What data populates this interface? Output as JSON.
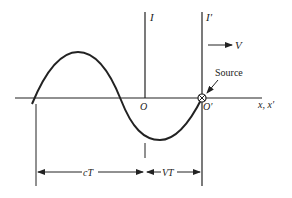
{
  "diagram": {
    "type": "wave-source-moving-frame",
    "labels": {
      "frame_I": "I",
      "frame_I_prime": "I′",
      "velocity": "V",
      "source": "Source",
      "origin_O": "O",
      "origin_O_prime": "O′",
      "axis": "x, x′",
      "dim_cT": "cT",
      "dim_VT": "VT"
    },
    "colors": {
      "ink": "#222222",
      "background": "#ffffff"
    }
  }
}
